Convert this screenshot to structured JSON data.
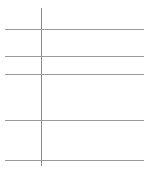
{
  "document": {
    "header_text": "",
    "table": {
      "row_line_positions_px": [
        29,
        56,
        74,
        120,
        160
      ],
      "column_divider_x_px": 41,
      "rows": [
        {
          "label": "",
          "value": ""
        },
        {
          "label": "",
          "value": ""
        },
        {
          "label": "",
          "value": ""
        },
        {
          "label": "",
          "value": ""
        },
        {
          "label": "",
          "value": ""
        }
      ]
    },
    "colors": {
      "line": "#9a9a9a",
      "background": "#ffffff"
    }
  }
}
